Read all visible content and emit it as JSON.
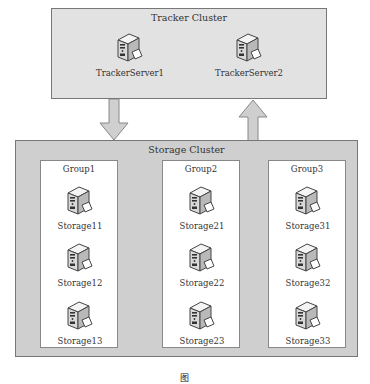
{
  "tracker_cluster": {
    "title": "Tracker Cluster",
    "servers": [
      {
        "label": "TrackerServer1"
      },
      {
        "label": "TrackerServer2"
      }
    ]
  },
  "storage_cluster": {
    "title": "Storage Cluster",
    "groups": [
      {
        "title": "Group1",
        "nodes": [
          {
            "label": "Storage11"
          },
          {
            "label": "Storage12"
          },
          {
            "label": "Storage13"
          }
        ]
      },
      {
        "title": "Group2",
        "nodes": [
          {
            "label": "Storage21"
          },
          {
            "label": "Storage22"
          },
          {
            "label": "Storage23"
          }
        ]
      },
      {
        "title": "Group3",
        "nodes": [
          {
            "label": "Storage31"
          },
          {
            "label": "Storage32"
          },
          {
            "label": "Storage33"
          }
        ]
      }
    ]
  },
  "arrows": [
    {
      "direction": "down",
      "from": "Tracker Cluster",
      "to": "Storage Cluster"
    },
    {
      "direction": "up",
      "from": "Storage Cluster",
      "to": "Tracker Cluster"
    }
  ],
  "caption": "图"
}
